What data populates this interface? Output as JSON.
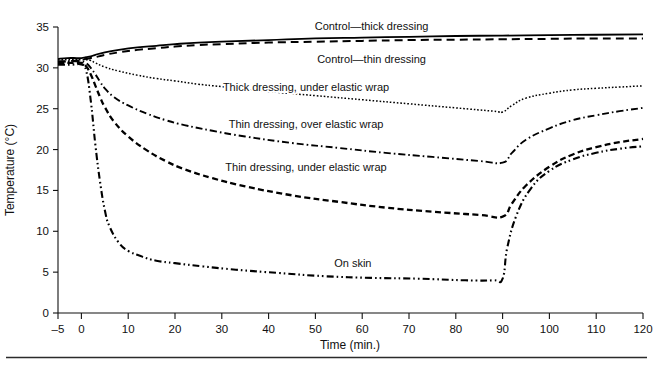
{
  "chart_data": {
    "type": "line",
    "title": "",
    "xlabel": "Time (min.)",
    "ylabel": "Temperature (°C)",
    "xlim": [
      -5,
      120
    ],
    "ylim": [
      0,
      35
    ],
    "xticks": [
      -5,
      0,
      10,
      20,
      30,
      40,
      50,
      60,
      70,
      80,
      90,
      100,
      110,
      120
    ],
    "xtick_labels": [
      "–5",
      "0",
      "10",
      "20",
      "30",
      "40",
      "50",
      "60",
      "70",
      "80",
      "90",
      "100",
      "110",
      "120"
    ],
    "yticks": [
      0,
      5,
      10,
      15,
      20,
      25,
      30,
      35
    ],
    "ytick_labels": [
      "0",
      "5",
      "10",
      "15",
      "20",
      "25",
      "30",
      "35"
    ],
    "grid": false,
    "legend": "inline-labels",
    "series": [
      {
        "name": "Control—thick dressing",
        "label": "Control—thick dressing",
        "line_style": "solid",
        "label_x": 62,
        "label_y": 34.6,
        "x": [
          -5,
          -3,
          -1,
          0,
          1,
          2,
          3,
          5,
          8,
          12,
          16,
          20,
          25,
          30,
          40,
          50,
          60,
          70,
          80,
          90,
          100,
          110,
          120
        ],
        "y": [
          31.1,
          31.2,
          31.2,
          31.2,
          31.3,
          31.4,
          31.6,
          31.9,
          32.2,
          32.5,
          32.7,
          32.9,
          33.1,
          33.2,
          33.4,
          33.6,
          33.7,
          33.8,
          33.9,
          33.95,
          34.0,
          34.05,
          34.1
        ]
      },
      {
        "name": "Control—thin dressing",
        "label": "Control—thin dressing",
        "line_style": "dashed",
        "label_x": 62,
        "label_y": 30.6,
        "x": [
          -5,
          -3,
          -1,
          0,
          1,
          2,
          3,
          5,
          8,
          12,
          16,
          20,
          25,
          30,
          40,
          50,
          60,
          70,
          80,
          90,
          100,
          110,
          120
        ],
        "y": [
          30.7,
          30.8,
          30.9,
          31.0,
          31.1,
          31.2,
          31.3,
          31.6,
          31.9,
          32.2,
          32.4,
          32.6,
          32.8,
          32.9,
          33.1,
          33.2,
          33.3,
          33.4,
          33.45,
          33.5,
          33.55,
          33.6,
          33.6
        ]
      },
      {
        "name": "Thick dressing, under elastic wrap",
        "label": "Thick dressing, under elastic wrap",
        "line_style": "dotted",
        "label_x": 48,
        "label_y": 27.2,
        "x": [
          -5,
          -2,
          0,
          1,
          2,
          3,
          5,
          8,
          12,
          16,
          20,
          25,
          30,
          40,
          50,
          60,
          70,
          80,
          88,
          90,
          92,
          95,
          100,
          105,
          110,
          115,
          120
        ],
        "y": [
          31.0,
          31.0,
          31.0,
          31.0,
          30.9,
          30.6,
          30.1,
          29.6,
          29.1,
          28.7,
          28.4,
          28.0,
          27.7,
          27.1,
          26.6,
          26.1,
          25.6,
          25.1,
          24.7,
          24.6,
          25.4,
          26.3,
          26.9,
          27.3,
          27.5,
          27.65,
          27.8
        ]
      },
      {
        "name": "Thin dressing, over elastic wrap",
        "label": "Thin dressing, over elastic wrap",
        "line_style": "dashdot",
        "label_x": 48,
        "label_y": 22.6,
        "x": [
          -5,
          -2,
          0,
          1,
          2,
          3,
          4,
          5,
          7,
          10,
          14,
          18,
          22,
          28,
          35,
          45,
          55,
          65,
          75,
          85,
          90,
          92,
          95,
          100,
          105,
          110,
          115,
          120
        ],
        "y": [
          30.8,
          30.8,
          30.8,
          30.6,
          30.0,
          29.2,
          28.3,
          27.5,
          26.4,
          25.4,
          24.4,
          23.6,
          23.0,
          22.3,
          21.6,
          20.8,
          20.2,
          19.6,
          19.1,
          18.6,
          18.4,
          19.6,
          21.2,
          22.6,
          23.6,
          24.2,
          24.7,
          25.1
        ]
      },
      {
        "name": "Thin dressing, under elastic wrap",
        "label": "Thin dressing, under elastic wrap",
        "line_style": "dashed-heavy",
        "label_x": 48,
        "label_y": 17.4,
        "x": [
          -5,
          -2,
          0,
          1,
          2,
          3,
          4,
          5,
          7,
          10,
          14,
          18,
          22,
          28,
          35,
          45,
          55,
          65,
          75,
          85,
          90,
          92,
          95,
          100,
          105,
          110,
          115,
          120
        ],
        "y": [
          30.6,
          30.6,
          30.6,
          30.2,
          29.2,
          27.8,
          26.4,
          25.2,
          23.4,
          21.6,
          19.9,
          18.6,
          17.6,
          16.5,
          15.5,
          14.4,
          13.6,
          12.9,
          12.4,
          12.0,
          11.8,
          13.4,
          15.6,
          17.9,
          19.4,
          20.3,
          20.9,
          21.3
        ]
      },
      {
        "name": "On skin",
        "label": "On skin",
        "line_style": "dashdotdot",
        "label_x": 58,
        "label_y": 5.6,
        "x": [
          -5,
          -2,
          0,
          1,
          2,
          3,
          4,
          5,
          6,
          8,
          10,
          13,
          16,
          20,
          26,
          33,
          42,
          52,
          62,
          72,
          82,
          88,
          90,
          91,
          93,
          96,
          100,
          105,
          110,
          115,
          120
        ],
        "y": [
          30.4,
          30.4,
          30.4,
          29.7,
          26.0,
          20.5,
          16.0,
          12.6,
          10.6,
          8.6,
          7.6,
          6.9,
          6.4,
          6.1,
          5.7,
          5.3,
          4.9,
          4.5,
          4.3,
          4.2,
          4.0,
          4.0,
          4.2,
          8.0,
          12.0,
          15.2,
          17.4,
          18.8,
          19.6,
          20.1,
          20.4
        ]
      }
    ]
  },
  "figure": {
    "axis_color": "#111111",
    "line_color": "#000000",
    "background": "#ffffff"
  }
}
